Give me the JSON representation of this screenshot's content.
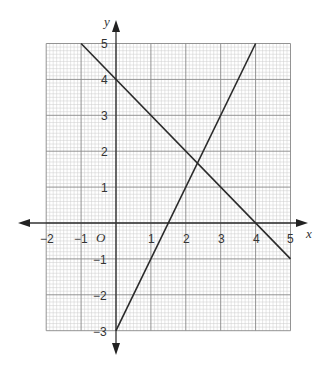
{
  "chart_data": {
    "type": "line",
    "title": "",
    "xlabel": "x",
    "ylabel": "y",
    "origin_label": "O",
    "xlim": [
      -2,
      5
    ],
    "ylim": [
      -3,
      5
    ],
    "grid": true,
    "grid_minor_divisions": 10,
    "x_ticks": [
      "-2",
      "-1",
      "1",
      "2",
      "3",
      "4",
      "5"
    ],
    "y_ticks": [
      "-3",
      "-2",
      "-1",
      "1",
      "2",
      "3",
      "4",
      "5"
    ],
    "series": [
      {
        "name": "y = 4 - x",
        "points": [
          [
            -1,
            5
          ],
          [
            5,
            -1
          ]
        ]
      },
      {
        "name": "y = 2x - 3",
        "points": [
          [
            0,
            -3
          ],
          [
            4,
            5
          ]
        ]
      }
    ],
    "intersection": [
      2.33,
      1.67
    ]
  },
  "labels": {
    "x_axis": "x",
    "y_axis": "y",
    "origin": "O",
    "xt_m2": "−2",
    "xt_m1": "−1",
    "xt_1": "1",
    "xt_2": "2",
    "xt_3": "3",
    "xt_4": "4",
    "xt_5": "5",
    "yt_m3": "−3",
    "yt_m2": "−2",
    "yt_m1": "−1",
    "yt_1": "1",
    "yt_2": "2",
    "yt_3": "3",
    "yt_4": "4",
    "yt_5": "5"
  },
  "colors": {
    "line": "#2a2a2a",
    "major_grid": "#888888",
    "minor_grid": "#cccccc"
  }
}
